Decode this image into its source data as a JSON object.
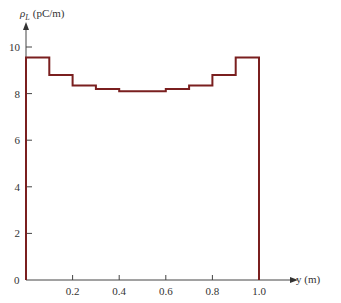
{
  "chart_data": {
    "type": "line",
    "style": "step",
    "title": "",
    "xlabel": "y (m)",
    "ylabel": "ρL (pC/m)",
    "ylabel_symbol": "ρ",
    "ylabel_subscript": "L",
    "ylabel_units": "(pC/m)",
    "xlim": [
      0,
      1.15
    ],
    "ylim": [
      0,
      10.5
    ],
    "x_ticks": [
      "0.2",
      "0.4",
      "0.6",
      "0.8",
      "1.0"
    ],
    "y_ticks": [
      "0",
      "2",
      "4",
      "6",
      "8",
      "10"
    ],
    "grid": false,
    "legend": null,
    "series": [
      {
        "name": "line charge density",
        "color": "#7a1f1f",
        "bins": [
          {
            "x0": 0.0,
            "x1": 0.1,
            "value": 9.55
          },
          {
            "x0": 0.1,
            "x1": 0.2,
            "value": 8.8
          },
          {
            "x0": 0.2,
            "x1": 0.3,
            "value": 8.35
          },
          {
            "x0": 0.3,
            "x1": 0.4,
            "value": 8.2
          },
          {
            "x0": 0.4,
            "x1": 0.6,
            "value": 8.1
          },
          {
            "x0": 0.6,
            "x1": 0.7,
            "value": 8.2
          },
          {
            "x0": 0.7,
            "x1": 0.8,
            "value": 8.35
          },
          {
            "x0": 0.8,
            "x1": 0.9,
            "value": 8.8
          },
          {
            "x0": 0.9,
            "x1": 1.0,
            "value": 9.55
          }
        ]
      }
    ]
  },
  "labels": {
    "origin": "0",
    "x_axis": "y (m)",
    "y_axis_symbol": "ρ",
    "y_axis_sub": "L",
    "y_axis_units": "(pC/m)"
  }
}
